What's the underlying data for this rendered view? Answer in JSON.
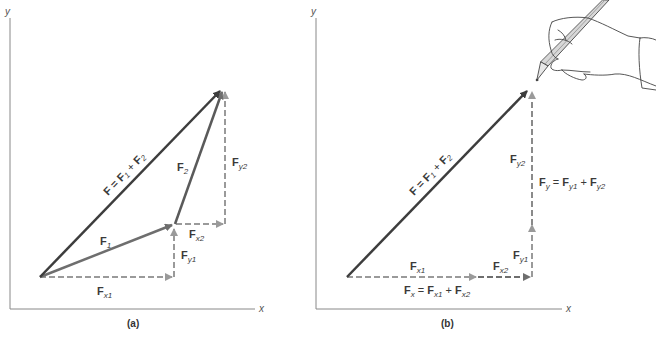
{
  "figure": {
    "colors": {
      "resultant": "#3d3d3d",
      "component_vector": "#6e6e6e",
      "dashed_component": "#9a9a9a",
      "axis": "#888888",
      "text": "#3a3a3a"
    },
    "panel_a": {
      "caption": "(a)",
      "axis_x": "x",
      "axis_y": "y",
      "resultant_label": {
        "F": "F",
        "eq": " = ",
        "F1": "F",
        "s1": "1",
        "plus": " + ",
        "F2": "F",
        "s2": "2"
      },
      "f1_label": {
        "main": "F",
        "sub": "1"
      },
      "f2_label": {
        "main": "F",
        "sub": "2"
      },
      "fx1_label": {
        "main": "F",
        "sub": "x1"
      },
      "fy1_label": {
        "main": "F",
        "sub": "y1"
      },
      "fx2_label": {
        "main": "F",
        "sub": "x2"
      },
      "fy2_label": {
        "main": "F",
        "sub": "y2"
      }
    },
    "panel_b": {
      "caption": "(b)",
      "axis_x": "x",
      "axis_y": "y",
      "resultant_label": {
        "F": "F",
        "eq": " = ",
        "F1": "F",
        "s1": "1",
        "plus": " + ",
        "F2": "F",
        "s2": "2"
      },
      "fx1_label": {
        "main": "F",
        "sub": "x1"
      },
      "fx2_label": {
        "main": "F",
        "sub": "x2"
      },
      "fy1_label": {
        "main": "F",
        "sub": "y1"
      },
      "fy2_label": {
        "main": "F",
        "sub": "y2"
      },
      "fx_sum": {
        "a": "F",
        "as": "x",
        "eq": " = ",
        "b": "F",
        "bs": "x1",
        "plus": " + ",
        "c": "F",
        "cs": "x2"
      },
      "fy_sum": {
        "a": "F",
        "as": "y",
        "eq": " = ",
        "b": "F",
        "bs": "y1",
        "plus": " + ",
        "c": "F",
        "cs": "y2"
      },
      "illustration": "hand-with-pencil"
    }
  }
}
